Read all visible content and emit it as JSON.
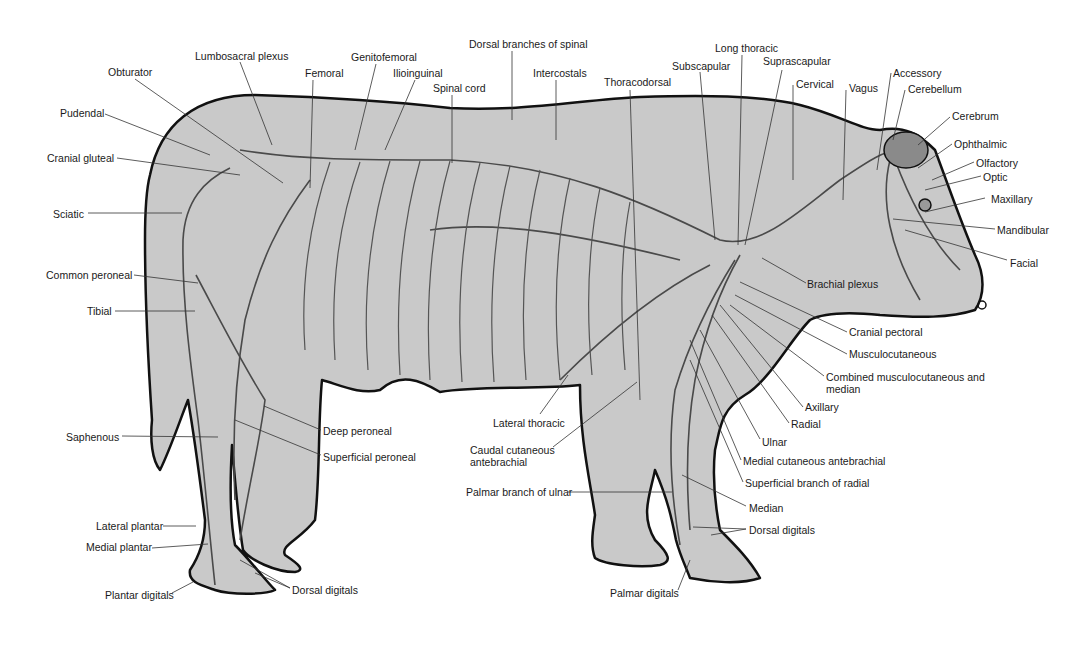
{
  "figure": {
    "colors": {
      "background": "#ffffff",
      "body_fill": "#c9c9c9",
      "outline": "#111111",
      "nerve": "#4a4a4a",
      "nerve_highlight": "#f2f2f2",
      "leader": "#333333",
      "label_text": "#1a1a1a"
    }
  },
  "labels": [
    {
      "id": "obturator",
      "text": "Obturator",
      "x": 108,
      "y": 66,
      "lx1": 135,
      "ly1": 79,
      "lx2": 283,
      "ly2": 183
    },
    {
      "id": "lumbosacral-plexus",
      "text": "Lumbosacral plexus",
      "x": 195,
      "y": 50,
      "lx1": 240,
      "ly1": 62,
      "lx2": 272,
      "ly2": 145
    },
    {
      "id": "femoral",
      "text": "Femoral",
      "x": 305,
      "y": 67,
      "lx1": 313,
      "ly1": 80,
      "lx2": 310,
      "ly2": 188
    },
    {
      "id": "genitofemoral",
      "text": "Genitofemoral",
      "x": 351,
      "y": 51,
      "lx1": 376,
      "ly1": 64,
      "lx2": 355,
      "ly2": 150
    },
    {
      "id": "ilioinguinal",
      "text": "Ilioinguinal",
      "x": 393,
      "y": 67,
      "lx1": 415,
      "ly1": 80,
      "lx2": 385,
      "ly2": 150
    },
    {
      "id": "spinal-cord",
      "text": "Spinal cord",
      "x": 433,
      "y": 82,
      "lx1": 452,
      "ly1": 95,
      "lx2": 452,
      "ly2": 163
    },
    {
      "id": "dorsal-branches",
      "text": "Dorsal branches of spinal",
      "x": 469,
      "y": 38,
      "lx1": 512,
      "ly1": 51,
      "lx2": 512,
      "ly2": 120
    },
    {
      "id": "intercostals",
      "text": "Intercostals",
      "x": 533,
      "y": 67,
      "lx1": 556,
      "ly1": 80,
      "lx2": 556,
      "ly2": 140
    },
    {
      "id": "thoracodorsal",
      "text": "Thoracodorsal",
      "x": 604,
      "y": 76,
      "lx1": 630,
      "ly1": 90,
      "lx2": 640,
      "ly2": 400
    },
    {
      "id": "subscapular",
      "text": "Subscapular",
      "x": 672,
      "y": 60,
      "lx1": 700,
      "ly1": 72,
      "lx2": 715,
      "ly2": 240
    },
    {
      "id": "long-thoracic",
      "text": "Long thoracic",
      "x": 715,
      "y": 42,
      "lx1": 742,
      "ly1": 55,
      "lx2": 738,
      "ly2": 245
    },
    {
      "id": "suprascapular",
      "text": "Suprascapular",
      "x": 763,
      "y": 55,
      "lx1": 782,
      "ly1": 70,
      "lx2": 745,
      "ly2": 245
    },
    {
      "id": "cervical",
      "text": "Cervical",
      "x": 796,
      "y": 78,
      "lx1": 793,
      "ly1": 85,
      "lx2": 793,
      "ly2": 180
    },
    {
      "id": "vagus",
      "text": "Vagus",
      "x": 849,
      "y": 82,
      "lx1": 846,
      "ly1": 90,
      "lx2": 843,
      "ly2": 200
    },
    {
      "id": "accessory",
      "text": "Accessory",
      "x": 893,
      "y": 67,
      "lx1": 891,
      "ly1": 73,
      "lx2": 877,
      "ly2": 170
    },
    {
      "id": "cerebellum",
      "text": "Cerebellum",
      "x": 908,
      "y": 83,
      "lx1": 905,
      "ly1": 90,
      "lx2": 893,
      "ly2": 140
    },
    {
      "id": "cerebrum",
      "text": "Cerebrum",
      "x": 952,
      "y": 110,
      "lx1": 950,
      "ly1": 117,
      "lx2": 918,
      "ly2": 145
    },
    {
      "id": "ophthalmic",
      "text": "Ophthalmic",
      "x": 954,
      "y": 138,
      "lx1": 952,
      "ly1": 144,
      "lx2": 918,
      "ly2": 168
    },
    {
      "id": "olfactory",
      "text": "Olfactory",
      "x": 976,
      "y": 157,
      "lx1": 974,
      "ly1": 162,
      "lx2": 932,
      "ly2": 180
    },
    {
      "id": "optic",
      "text": "Optic",
      "x": 983,
      "y": 171,
      "lx1": 981,
      "ly1": 176,
      "lx2": 925,
      "ly2": 190
    },
    {
      "id": "maxillary",
      "text": "Maxillary",
      "x": 991,
      "y": 193,
      "lx1": 985,
      "ly1": 198,
      "lx2": 925,
      "ly2": 212
    },
    {
      "id": "mandibular",
      "text": "Mandibular",
      "x": 997,
      "y": 224,
      "lx1": 995,
      "ly1": 229,
      "lx2": 893,
      "ly2": 219
    },
    {
      "id": "facial",
      "text": "Facial",
      "x": 1010,
      "y": 257,
      "lx1": 1007,
      "ly1": 260,
      "lx2": 905,
      "ly2": 230
    },
    {
      "id": "brachial-plexus",
      "text": "Brachial plexus",
      "x": 807,
      "y": 278,
      "lx1": 806,
      "ly1": 283,
      "lx2": 762,
      "ly2": 258
    },
    {
      "id": "cranial-pectoral",
      "text": "Cranial pectoral",
      "x": 849,
      "y": 326,
      "lx1": 847,
      "ly1": 332,
      "lx2": 740,
      "ly2": 282
    },
    {
      "id": "musculocutaneous",
      "text": "Musculocutaneous",
      "x": 849,
      "y": 348,
      "lx1": 847,
      "ly1": 354,
      "lx2": 735,
      "ly2": 295
    },
    {
      "id": "combined-musc-median",
      "text": "Combined musculocutaneous and median",
      "x": 826,
      "y": 371,
      "lx1": 824,
      "ly1": 376,
      "lx2": 730,
      "ly2": 305,
      "two_line": true
    },
    {
      "id": "axillary",
      "text": "Axillary",
      "x": 805,
      "y": 401,
      "lx1": 803,
      "ly1": 407,
      "lx2": 720,
      "ly2": 305
    },
    {
      "id": "radial",
      "text": "Radial",
      "x": 791,
      "y": 418,
      "lx1": 789,
      "ly1": 423,
      "lx2": 712,
      "ly2": 315
    },
    {
      "id": "ulnar",
      "text": "Ulnar",
      "x": 762,
      "y": 436,
      "lx1": 760,
      "ly1": 439,
      "lx2": 700,
      "ly2": 330
    },
    {
      "id": "medial-cutaneous-ante",
      "text": "Medial cutaneous antebrachial",
      "x": 743,
      "y": 455,
      "lx1": 741,
      "ly1": 460,
      "lx2": 690,
      "ly2": 340
    },
    {
      "id": "superficial-radial",
      "text": "Superficial branch of radial",
      "x": 745,
      "y": 477,
      "lx1": 743,
      "ly1": 482,
      "lx2": 690,
      "ly2": 360
    },
    {
      "id": "median",
      "text": "Median",
      "x": 749,
      "y": 502,
      "lx1": 746,
      "ly1": 506,
      "lx2": 682,
      "ly2": 475
    },
    {
      "id": "dorsal-digitals-fore",
      "text": "Dorsal digitals",
      "x": 749,
      "y": 524,
      "lx1": 746,
      "ly1": 529,
      "lx2": 693,
      "ly2": 527,
      "lx3": 711,
      "ly3": 535
    },
    {
      "id": "palmar-branch-ulnar",
      "text": "Palmar branch of ulnar",
      "x": 466,
      "y": 486,
      "lx1": 568,
      "ly1": 492,
      "lx2": 672,
      "ly2": 492
    },
    {
      "id": "palmar-digitals",
      "text": "Palmar digitals",
      "x": 610,
      "y": 587,
      "lx1": 678,
      "ly1": 590,
      "lx2": 690,
      "ly2": 560
    },
    {
      "id": "lateral-thoracic",
      "text": "Lateral thoracic",
      "x": 493,
      "y": 417,
      "lx1": 540,
      "ly1": 414,
      "lx2": 568,
      "ly2": 375
    },
    {
      "id": "caudal-cutaneous-ante",
      "text": "Caudal cutaneous antebrachial",
      "x": 470,
      "y": 444,
      "lx1": 553,
      "ly1": 447,
      "lx2": 637,
      "ly2": 382,
      "two_line": true
    },
    {
      "id": "deep-peroneal",
      "text": "Deep peroneal",
      "x": 323,
      "y": 425,
      "lx1": 321,
      "ly1": 430,
      "lx2": 264,
      "ly2": 406
    },
    {
      "id": "superficial-peroneal",
      "text": "Superficial peroneal",
      "x": 323,
      "y": 451,
      "lx1": 321,
      "ly1": 455,
      "lx2": 235,
      "ly2": 420
    },
    {
      "id": "saphenous",
      "text": "Saphenous",
      "x": 66,
      "y": 431,
      "lx1": 122,
      "ly1": 436,
      "lx2": 218,
      "ly2": 437
    },
    {
      "id": "lateral-plantar",
      "text": "Lateral plantar",
      "x": 96,
      "y": 520,
      "lx1": 163,
      "ly1": 526,
      "lx2": 196,
      "ly2": 526
    },
    {
      "id": "medial-plantar",
      "text": "Medial plantar",
      "x": 86,
      "y": 541,
      "lx1": 152,
      "ly1": 548,
      "lx2": 208,
      "ly2": 544
    },
    {
      "id": "dorsal-digitals-hind",
      "text": "Dorsal digitals",
      "x": 292,
      "y": 584,
      "lx1": 290,
      "ly1": 588,
      "lx2": 240,
      "ly2": 560,
      "lx3": 255,
      "ly3": 573
    },
    {
      "id": "plantar-digitals",
      "text": "Plantar digitals",
      "x": 105,
      "y": 589,
      "lx1": 172,
      "ly1": 593,
      "lx2": 193,
      "ly2": 582
    },
    {
      "id": "sciatic",
      "text": "Sciatic",
      "x": 53,
      "y": 208,
      "lx1": 88,
      "ly1": 213,
      "lx2": 182,
      "ly2": 213
    },
    {
      "id": "common-peroneal",
      "text": "Common peroneal",
      "x": 46,
      "y": 269,
      "lx1": 134,
      "ly1": 275,
      "lx2": 198,
      "ly2": 283
    },
    {
      "id": "tibial",
      "text": "Tibial",
      "x": 87,
      "y": 305,
      "lx1": 115,
      "ly1": 311,
      "lx2": 195,
      "ly2": 311
    },
    {
      "id": "cranial-gluteal",
      "text": "Cranial gluteal",
      "x": 47,
      "y": 152,
      "lx1": 117,
      "ly1": 158,
      "lx2": 240,
      "ly2": 175
    },
    {
      "id": "pudendal",
      "text": "Pudendal",
      "x": 60,
      "y": 107,
      "lx1": 105,
      "ly1": 114,
      "lx2": 210,
      "ly2": 155
    }
  ]
}
